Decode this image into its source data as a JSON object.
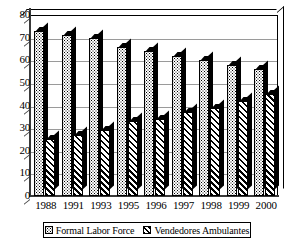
{
  "chart_data": {
    "type": "bar",
    "title": "",
    "subtitle": "",
    "xlabel": "",
    "ylabel": "",
    "categories": [
      "1988",
      "1991",
      "1993",
      "1995",
      "1996",
      "1997",
      "1998",
      "1999",
      "2000"
    ],
    "series": [
      {
        "name": "Formal Labor Force",
        "pattern": "dotted",
        "values": [
          73,
          71,
          70,
          66,
          64,
          62,
          60,
          58,
          56
        ]
      },
      {
        "name": "Vendedores Ambulantes",
        "pattern": "diagonal-hatch",
        "values": [
          25,
          27,
          29,
          33,
          34,
          37,
          39,
          42,
          45
        ]
      }
    ],
    "ylim": [
      0,
      80
    ],
    "ytick_values": [
      0,
      10,
      20,
      30,
      40,
      50,
      60,
      70,
      80
    ],
    "ytick_labels": [
      "0",
      "10",
      "20",
      "30",
      "40",
      "50",
      "60",
      "70",
      "80"
    ],
    "grid": true,
    "grid_axis": "y",
    "legend_position": "bottom",
    "style": "3d-bar",
    "colors": {
      "series_formal": "#ffffff",
      "series_vendors": "#ffffff",
      "outline": "#000000",
      "gridline": "#9a9a9a",
      "axis": "#3a3a3a",
      "background": "#ffffff"
    }
  },
  "legend": {
    "entries": [
      {
        "label": "Formal Labor Force",
        "marker": "dotted-square-icon"
      },
      {
        "label": "Vendedores Ambulantes",
        "marker": "hatched-square-icon"
      }
    ]
  }
}
